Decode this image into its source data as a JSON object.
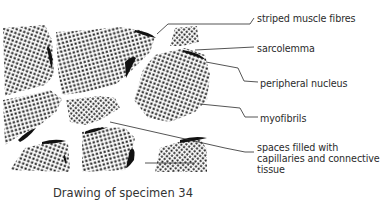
{
  "figure": {
    "caption": "Drawing of specimen 34"
  },
  "labels": [
    {
      "id": "striped-muscle-fibres",
      "text": "striped muscle fibres",
      "x": 257,
      "y": 13
    },
    {
      "id": "sarcolemma",
      "text": "sarcolemma",
      "x": 257,
      "y": 43
    },
    {
      "id": "peripheral-nucleus",
      "text": "peripheral nucleus",
      "x": 260,
      "y": 78
    },
    {
      "id": "myofibrils",
      "text": "myofibrils",
      "x": 260,
      "y": 113
    },
    {
      "id": "spaces-line1",
      "text": "spaces filled with",
      "x": 257,
      "y": 142
    },
    {
      "id": "spaces-line2",
      "text": "capillaries and connective",
      "x": 257,
      "y": 153
    },
    {
      "id": "spaces-line3",
      "text": "tissue",
      "x": 257,
      "y": 164
    }
  ],
  "colors": {
    "ink": "#1a1a1a",
    "background": "#ffffff",
    "text": "#2b2b2b"
  }
}
